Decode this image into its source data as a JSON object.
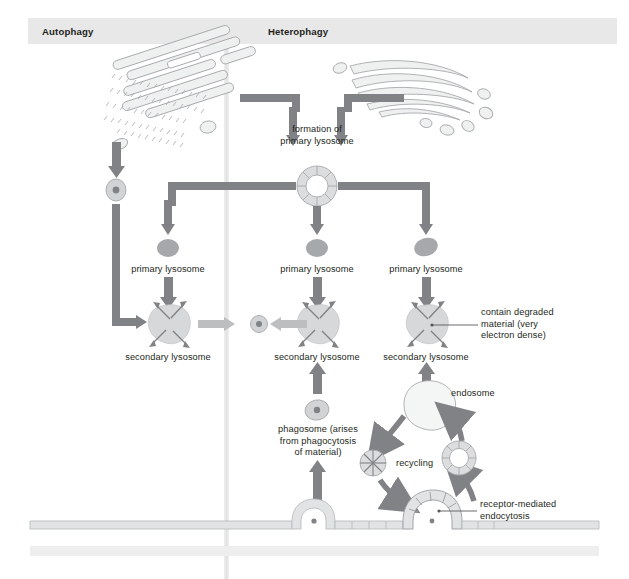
{
  "figure": {
    "title_regions": {
      "left_label": "Autophagy",
      "right_label": "Heterophagy"
    },
    "background": "#ffffff",
    "header_band_color": "#e8e8e8",
    "divider_color": "#e6e6e6"
  },
  "colors": {
    "arrow_dark": "#808285",
    "arrow_light": "#bcbec0",
    "organelle_fill": "#e6e7e8",
    "organelle_stroke": "#a7a9ac",
    "lysosome_fill": "#939598",
    "secondary_fill": "#d7d8da",
    "membrane_fill": "#e2e3e4",
    "text": "#231f20",
    "leader_line": "#58595b"
  },
  "labels": {
    "formation": "formation of\nprimary lysosome",
    "primary_lysosome_left": "primary lysosome",
    "primary_lysosome_mid": "primary lysosome",
    "primary_lysosome_right": "primary lysosome",
    "secondary_lysosome_left": "secondary lysosome",
    "secondary_lysosome_mid": "secondary lysosome",
    "secondary_lysosome_right": "secondary lysosome",
    "contain_degraded": "contain degraded\nmaterial (very\nelectron dense)",
    "phagosome": "phagosome (arises\nfrom phagocytosis\nof material)",
    "endosome": "endosome",
    "recycling": "recycling",
    "receptor_mediated": "receptor-mediated\nendocytosis"
  },
  "icon_names": {
    "rough_er": "rough-endoplasmic-reticulum-icon",
    "golgi": "golgi-apparatus-icon",
    "coated_vesicle": "coated-vesicle-icon",
    "primary_lysosome": "primary-lysosome-icon",
    "secondary_lysosome": "secondary-lysosome-icon",
    "residual_body": "residual-body-icon",
    "autophagosome": "autophagosome-icon",
    "phagosome": "phagosome-icon",
    "endosome": "endosome-icon",
    "recycling_vesicle": "recycling-vesicle-icon",
    "plasma_membrane": "plasma-membrane-icon",
    "phagocytosis_pit": "phagocytosis-invagination-icon",
    "coated_pit": "coated-pit-icon"
  }
}
